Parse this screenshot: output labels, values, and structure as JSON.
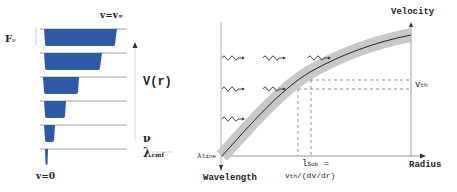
{
  "left_panel": {
    "flux_label": "F",
    "flux_sub": "ν",
    "top_label": "v=v",
    "top_sub": "∞",
    "bottom_label": "v=0",
    "axis_label": "V(r)",
    "x_label_nu": "ν",
    "x_label_lambda": "λ",
    "x_label_lambda_sub": "cmf",
    "profile_color": "#2f58a8",
    "profiles": [
      {
        "row": 1,
        "width": 75
      },
      {
        "row": 2,
        "width": 60
      },
      {
        "row": 3,
        "width": 37
      },
      {
        "row": 4,
        "width": 24
      },
      {
        "row": 5,
        "width": 12
      },
      {
        "row": 6,
        "width": 3
      }
    ]
  },
  "right_panel": {
    "y_axis_label": "Velocity",
    "x_axis_label": "Radius",
    "down_axis_label": "Wavelength",
    "line_label": "λ",
    "line_label_sub": "line",
    "vth_label": "v",
    "vth_sub": "th",
    "sobolev_label": "l",
    "sobolev_sub": "Sob",
    "sobolev_eq": "=",
    "sobolev_formula_v": "v",
    "sobolev_formula_sub": "th",
    "sobolev_formula_rest": "/(dv/dr)",
    "band_color": "#c8c8c8",
    "curve_color": "#222222",
    "photon_rows": [
      {
        "y": 58,
        "count": 3
      },
      {
        "y": 88,
        "count": 2
      },
      {
        "y": 118,
        "count": 1
      }
    ]
  }
}
